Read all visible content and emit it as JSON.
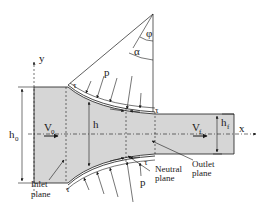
{
  "diagram": {
    "colors": {
      "strip_fill": "#d6d6d6",
      "line": "#1a1a1a",
      "background": "#ffffff"
    },
    "axes": {
      "x_label": "x",
      "y_label": "y"
    },
    "angles": {
      "phi": "φ",
      "alpha": "α"
    },
    "thickness": {
      "h0": "h",
      "h0_sub": "0",
      "h": "h",
      "hf": "h",
      "hf_sub": "f"
    },
    "velocity": {
      "v0": "V",
      "v0_sub": "0",
      "vf": "V",
      "vf_sub": "f"
    },
    "forces": {
      "pressure_top": "p",
      "pressure_bottom": "p",
      "shear_top_left": "τ",
      "shear_top_right": "τ",
      "shear_bottom_left": "τ",
      "shear_bottom_right": "τ"
    },
    "planes": {
      "inlet_line1": "Inlet",
      "inlet_line2": "plane",
      "neutral_line1": "Neutral",
      "neutral_line2": "plane",
      "outlet_line1": "Outlet",
      "outlet_line2": "plane"
    }
  }
}
